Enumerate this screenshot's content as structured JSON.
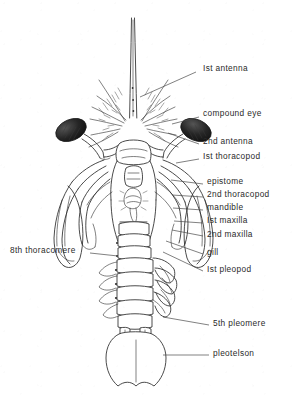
{
  "figure": {
    "kind": "scientific-line-illustration",
    "ink_color": "#2b2b2b",
    "eye_color": "#1c1c1c",
    "background_color": "#ffffff"
  },
  "labels": [
    {
      "id": "first-antenna",
      "text": "Ist antenna",
      "side": "right",
      "x": 203,
      "y": 68,
      "leader": [
        196,
        72,
        140,
        97
      ]
    },
    {
      "id": "compound-eye",
      "text": "compound eye",
      "side": "right",
      "x": 203,
      "y": 113,
      "leader": [
        199,
        117,
        172,
        124
      ]
    },
    {
      "id": "second-antenna",
      "text": "2nd antenna",
      "side": "right",
      "x": 203,
      "y": 141,
      "leader": [
        199,
        144,
        168,
        133
      ]
    },
    {
      "id": "first-thoracopod",
      "text": "Ist thoracopod",
      "side": "right",
      "x": 203,
      "y": 156,
      "leader": [
        199,
        159,
        176,
        163
      ]
    },
    {
      "id": "epistome",
      "text": "epistome",
      "side": "right",
      "x": 207,
      "y": 181,
      "leader": [
        203,
        184,
        171,
        180
      ]
    },
    {
      "id": "second-thoracopod",
      "text": "2nd thoracopod",
      "side": "right",
      "x": 207,
      "y": 194,
      "leader": [
        203,
        197,
        172,
        195
      ]
    },
    {
      "id": "mandible",
      "text": "mandible",
      "side": "right",
      "x": 207,
      "y": 207,
      "leader": [
        203,
        210,
        173,
        208
      ]
    },
    {
      "id": "first-maxilla",
      "text": "Ist maxilla",
      "side": "right",
      "x": 207,
      "y": 220,
      "leader": [
        203,
        223,
        174,
        221
      ]
    },
    {
      "id": "second-maxilla",
      "text": "2nd maxilla",
      "side": "right",
      "x": 207,
      "y": 234,
      "leader": [
        203,
        236,
        172,
        230
      ]
    },
    {
      "id": "gill",
      "text": "gill",
      "side": "right",
      "x": 207,
      "y": 252,
      "leader": [
        203,
        254,
        166,
        241
      ]
    },
    {
      "id": "first-pleopod",
      "text": "Ist pleopod",
      "side": "right",
      "x": 207,
      "y": 269,
      "leader": [
        203,
        271,
        163,
        252
      ]
    },
    {
      "id": "fifth-pleomere",
      "text": "5th pleomere",
      "side": "right",
      "x": 213,
      "y": 323,
      "leader": [
        209,
        325,
        163,
        317
      ]
    },
    {
      "id": "pleotelson",
      "text": "pleotelson",
      "side": "right",
      "x": 213,
      "y": 353,
      "leader": [
        209,
        355,
        163,
        355
      ]
    },
    {
      "id": "eighth-thoracomere",
      "text": "8th thoracomere",
      "side": "left",
      "x": 13,
      "y": 250,
      "leader": [
        90,
        253,
        118,
        256
      ]
    }
  ]
}
